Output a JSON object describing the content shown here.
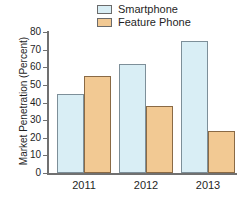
{
  "chart_data": {
    "type": "bar",
    "title": "",
    "subtitle": "",
    "xlabel": "",
    "ylabel": "Market Penetration (Percent)",
    "categories": [
      "2011",
      "2012",
      "2013"
    ],
    "series": [
      {
        "name": "Smartphone",
        "values": [
          45,
          62,
          75
        ],
        "color": "#d9eef5"
      },
      {
        "name": "Feature Phone",
        "values": [
          55,
          38,
          24
        ],
        "color": "#f2c993"
      }
    ],
    "ylim": [
      0,
      80
    ],
    "ytick_labels": [
      "80",
      "70",
      "60",
      "50",
      "40",
      "30",
      "20",
      "10",
      "0"
    ],
    "ytick_values": [
      80,
      70,
      60,
      50,
      40,
      30,
      20,
      10,
      0
    ],
    "grid": false,
    "legend_position": "top-center"
  },
  "legend": {
    "items": [
      {
        "label": "Smartphone"
      },
      {
        "label": "Feature Phone"
      }
    ]
  },
  "axes": {
    "y_label": "Market Penetration (Percent)"
  }
}
